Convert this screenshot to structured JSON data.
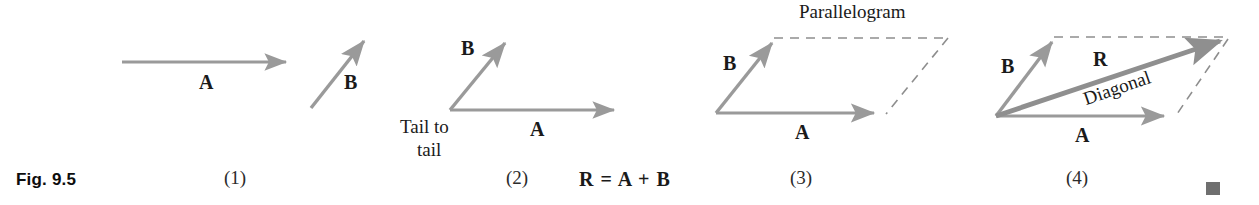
{
  "figure": {
    "caption": "Fig. 9.5",
    "end_marker_color": "#6f6f6f",
    "vector_color": "#9a9a9a",
    "dash_color": "#8e8e8e",
    "text_color": "#1a1a1a"
  },
  "panels": [
    {
      "number": "(1)",
      "labels": {
        "a": "A",
        "b": "B"
      }
    },
    {
      "number": "(2)",
      "labels": {
        "a": "A",
        "b": "B",
        "note_line1": "Tail to",
        "note_line2": "tail"
      }
    },
    {
      "number": "(3)",
      "labels": {
        "a": "A",
        "b": "B",
        "shape": "Parallelogram"
      }
    },
    {
      "number": "(4)",
      "labels": {
        "a": "A",
        "b": "B",
        "r": "R",
        "diagonal": "Diagonal"
      }
    }
  ],
  "equation": "R = A + B"
}
